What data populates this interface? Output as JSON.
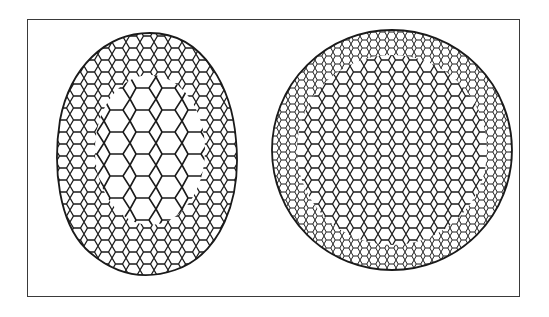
{
  "figure": {
    "panels": [
      {
        "name": "egg-shaped-mesh",
        "shape": "ovoid",
        "position": "left",
        "cell_style": "irregular polygonal cells, larger cells in center"
      },
      {
        "name": "spherical-mesh",
        "shape": "sphere",
        "position": "right",
        "cell_style": "small regular hexagonal cells"
      }
    ],
    "colors": {
      "line": "#1a1a1a",
      "background": "#ffffff",
      "frame": "#3a3a3a"
    }
  }
}
